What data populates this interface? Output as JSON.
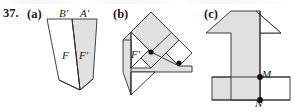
{
  "figure": {
    "problem_number": "37.",
    "background_color": "#ffffff",
    "stroke_color": "#2b2b2b",
    "fill_color": "#e0e0e0",
    "parts": [
      {
        "key": "a",
        "label": "(a)",
        "description": "Two overlapping slanted parallelogram-like quadrilaterals, the right one shaded",
        "labels": [
          {
            "name": "B-prime",
            "text": "B′"
          },
          {
            "name": "A-prime",
            "text": "A′"
          },
          {
            "name": "F",
            "text": "F"
          },
          {
            "name": "F-prime",
            "text": "F′"
          }
        ]
      },
      {
        "key": "b",
        "label": "(b)",
        "description": "Rotated composite polygon of shaded triangles and a white square with two marked points",
        "labels": [
          {
            "name": "F-prime",
            "text": "F′"
          }
        ]
      },
      {
        "key": "c",
        "label": "(c)",
        "description": "Upward arrow / numeral-one shape overlapping a horizontal rectangular band, with points M and N marked",
        "labels": [
          {
            "name": "M",
            "text": "M"
          },
          {
            "name": "N",
            "text": "N"
          }
        ]
      }
    ]
  },
  "colors": {
    "shape_fill": "#e0e0e0",
    "shape_stroke": "#2b2b2b",
    "text": "#1a1a1a",
    "page": "#ffffff"
  }
}
